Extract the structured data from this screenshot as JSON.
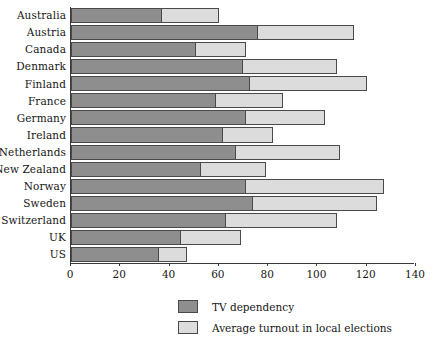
{
  "chart_data": {
    "type": "bar",
    "orientation": "horizontal",
    "stacked": true,
    "title": "",
    "xlabel": "",
    "ylabel": "",
    "xlim": [
      0,
      140
    ],
    "xticks": [
      0,
      20,
      40,
      60,
      80,
      100,
      120,
      140
    ],
    "xticklabels": [
      "0",
      "20",
      "40",
      "60",
      "80",
      "100",
      "120",
      "140"
    ],
    "grid": false,
    "legend_position": "bottom",
    "categories": [
      "Australia",
      "Austria",
      "Canada",
      "Denmark",
      "Finland",
      "France",
      "Germany",
      "Ireland",
      "Netherlands",
      "New Zealand",
      "Norway",
      "Sweden",
      "Switzerland",
      "UK",
      "US"
    ],
    "series": [
      {
        "name": "TV dependency",
        "color": "#8e8e8e",
        "values": [
          36,
          75,
          50,
          69,
          72,
          58,
          70,
          61,
          66,
          52,
          70,
          73,
          62,
          44,
          35
        ]
      },
      {
        "name": "Average turnout in local elections",
        "color": "#dcdcdc",
        "values": [
          24,
          40,
          21,
          39,
          48,
          28,
          33,
          21,
          43,
          27,
          57,
          51,
          46,
          25,
          12
        ]
      }
    ],
    "totals": [
      60,
      115,
      71,
      108,
      120,
      86,
      103,
      82,
      109,
      79,
      127,
      124,
      108,
      69,
      47
    ]
  },
  "legend": {
    "items": [
      {
        "label": "TV dependency",
        "color": "#8e8e8e"
      },
      {
        "label": "Average turnout in local elections",
        "color": "#dcdcdc"
      }
    ]
  },
  "caption": ""
}
